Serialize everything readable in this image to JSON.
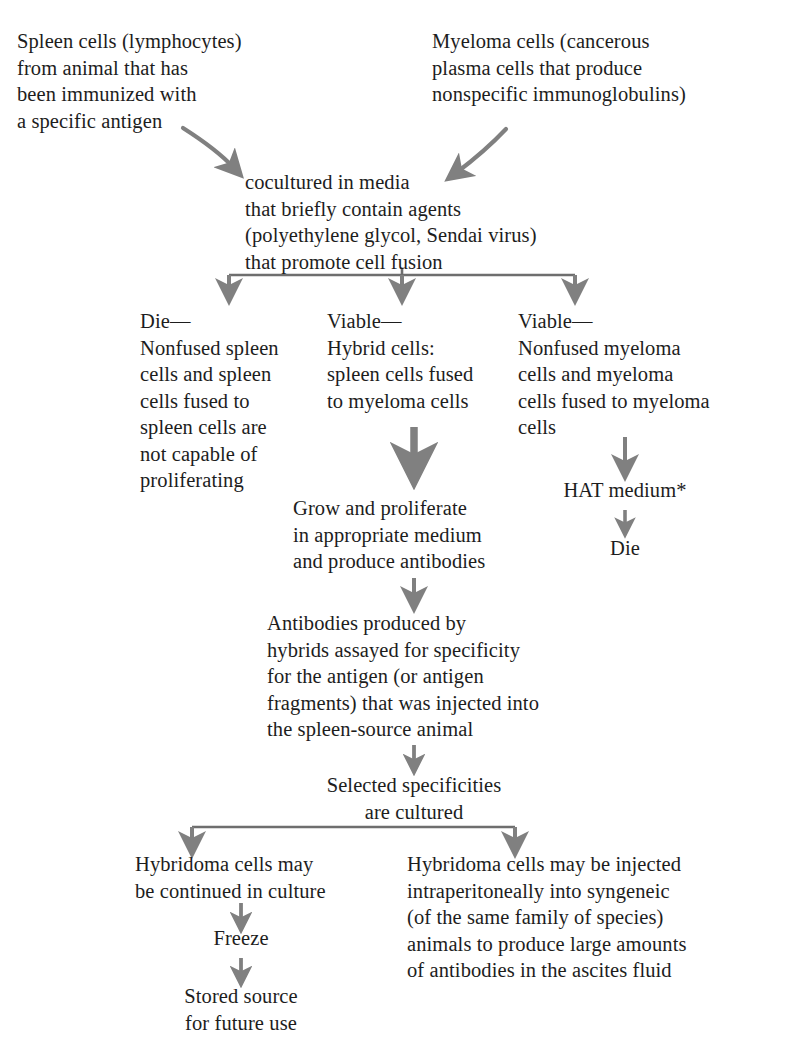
{
  "diagram": {
    "arrow_color": "#808080",
    "text_color": "#1d1d1d",
    "background_color": "#ffffff"
  },
  "nodes": {
    "spleen_cells": "Spleen cells (lymphocytes)\nfrom animal that has\nbeen immunized with\na specific antigen",
    "myeloma_cells": "Myeloma cells (cancerous\nplasma cells that produce\nnonspecific immunoglobulins)",
    "cocultured": "cocultured in media\nthat briefly contain agents\n(polyethylene glycol, Sendai virus)\nthat promote cell fusion",
    "branch_left": "Die—\nNonfused spleen\ncells and spleen\ncells fused to\nspleen cells are\nnot capable of\nproliferating",
    "branch_center": "Viable—\nHybrid cells:\nspleen cells fused\nto myeloma cells",
    "branch_right": "Viable—\nNonfused myeloma\ncells and myeloma\ncells fused to myeloma\ncells",
    "hat_medium": "HAT medium*",
    "die_right": "Die",
    "grow_proliferate": "Grow and proliferate\nin appropriate medium\nand produce antibodies",
    "antibodies_assayed": "Antibodies produced by\nhybrids assayed for specificity\nfor the antigen (or antigen\nfragments) that was injected into\nthe spleen-source animal",
    "selected_specificities": "Selected specificities\nare cultured",
    "bottom_left": "Hybridoma cells may\nbe continued in culture",
    "freeze": "Freeze",
    "stored_source": "Stored source\nfor future use",
    "bottom_right": "Hybridoma cells may be injected\nintraperitoneally into syngeneic\n(of the same family of species)\nanimals to produce large amounts\nof antibodies in the ascites fluid"
  },
  "connectors": {
    "curve_left_label": "curved-arrow-spleen-to-coculture",
    "curve_right_label": "curved-arrow-myeloma-to-coculture",
    "split_three_label": "three-way-split-connector",
    "arrow_hybrid_down_label": "thick-arrow-hybrid-to-grow",
    "arrow_grow_to_assay_label": "arrow-grow-to-assay",
    "arrow_assay_to_selected_label": "arrow-assay-to-selected",
    "split_two_label": "two-way-split-connector",
    "arrow_myeloma_to_hat_label": "arrow-myeloma-to-hat",
    "arrow_hat_to_die_label": "arrow-hat-to-die",
    "arrow_culture_to_freeze_label": "arrow-culture-to-freeze",
    "arrow_freeze_to_stored_label": "arrow-freeze-to-stored"
  }
}
